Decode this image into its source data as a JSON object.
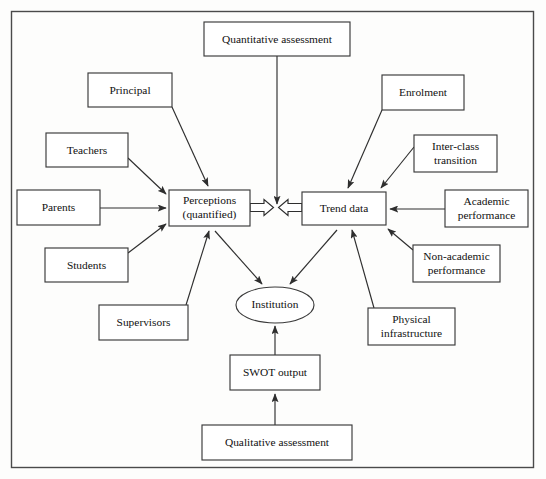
{
  "diagram": {
    "frame": {
      "x": 11,
      "y": 11,
      "width": 523,
      "height": 457
    },
    "colors": {
      "background": "#fdfdfc",
      "node_fill": "#ffffff",
      "node_stroke": "#3a3a3a",
      "edge_stroke": "#2e2e2e",
      "text": "#111111"
    },
    "nodes": [
      {
        "id": "quantitative_assessment",
        "label": "Quantitative assessment",
        "shape": "rect",
        "x": 204,
        "y": 22,
        "width": 146,
        "height": 34,
        "lines": [
          "Quantitative assessment"
        ]
      },
      {
        "id": "principal",
        "label": "Principal",
        "shape": "rect",
        "x": 88,
        "y": 73,
        "width": 84,
        "height": 34,
        "lines": [
          "Principal"
        ]
      },
      {
        "id": "enrolment",
        "label": "Enrolment",
        "shape": "rect",
        "x": 382,
        "y": 75,
        "width": 82,
        "height": 35,
        "lines": [
          "Enrolment"
        ]
      },
      {
        "id": "teachers",
        "label": "Teachers",
        "shape": "rect",
        "x": 46,
        "y": 133,
        "width": 82,
        "height": 34,
        "lines": [
          "Teachers"
        ]
      },
      {
        "id": "inter_class_transition",
        "label": "Inter-class transition",
        "shape": "rect",
        "x": 414,
        "y": 135,
        "width": 83,
        "height": 37,
        "lines": [
          "Inter-class",
          "transition"
        ]
      },
      {
        "id": "parents",
        "label": "Parents",
        "shape": "rect",
        "x": 17,
        "y": 190,
        "width": 83,
        "height": 35,
        "lines": [
          "Parents"
        ]
      },
      {
        "id": "perceptions",
        "label": "Perceptions (quantified)",
        "shape": "rect",
        "x": 169,
        "y": 190,
        "width": 81,
        "height": 36,
        "lines": [
          "Perceptions",
          "(quantified)"
        ]
      },
      {
        "id": "trend_data",
        "label": "Trend data",
        "shape": "rect",
        "x": 302,
        "y": 192,
        "width": 84,
        "height": 33,
        "lines": [
          "Trend data"
        ]
      },
      {
        "id": "academic_performance",
        "label": "Academic performance",
        "shape": "rect",
        "x": 445,
        "y": 190,
        "width": 83,
        "height": 37,
        "lines": [
          "Academic",
          "performance"
        ]
      },
      {
        "id": "students",
        "label": "Students",
        "shape": "rect",
        "x": 45,
        "y": 248,
        "width": 83,
        "height": 34,
        "lines": [
          "Students"
        ]
      },
      {
        "id": "non_academic_performance",
        "label": "Non-academic performance",
        "shape": "rect",
        "x": 413,
        "y": 245,
        "width": 87,
        "height": 37,
        "lines": [
          "Non-academic",
          "performance"
        ]
      },
      {
        "id": "institution",
        "label": "Institution",
        "shape": "ellipse",
        "x": 236,
        "y": 287,
        "width": 78,
        "height": 36,
        "lines": [
          "Institution"
        ]
      },
      {
        "id": "supervisors",
        "label": "Supervisors",
        "shape": "rect",
        "x": 99,
        "y": 305,
        "width": 89,
        "height": 35,
        "lines": [
          "Supervisors"
        ]
      },
      {
        "id": "physical_infrastructure",
        "label": "Physical infrastructure",
        "shape": "rect",
        "x": 368,
        "y": 308,
        "width": 87,
        "height": 37,
        "lines": [
          "Physical",
          "infrastructure"
        ]
      },
      {
        "id": "swot_output",
        "label": "SWOT output",
        "shape": "rect",
        "x": 230,
        "y": 355,
        "width": 90,
        "height": 35,
        "lines": [
          "SWOT output"
        ]
      },
      {
        "id": "qualitative_assessment",
        "label": "Qualitative assessment",
        "shape": "rect",
        "x": 202,
        "y": 425,
        "width": 150,
        "height": 35,
        "lines": [
          "Qualitative assessment"
        ]
      }
    ],
    "edges": [
      {
        "id": "principal-to-perceptions",
        "from": "principal",
        "to": "perceptions",
        "style": "line-arrow"
      },
      {
        "id": "teachers-to-perceptions",
        "from": "teachers",
        "to": "perceptions",
        "style": "line-arrow"
      },
      {
        "id": "parents-to-perceptions",
        "from": "parents",
        "to": "perceptions",
        "style": "line-arrow"
      },
      {
        "id": "students-to-perceptions",
        "from": "students",
        "to": "perceptions",
        "style": "line-arrow"
      },
      {
        "id": "supervisors-to-perceptions",
        "from": "supervisors",
        "to": "perceptions",
        "style": "line-arrow"
      },
      {
        "id": "enrolment-to-trend-data",
        "from": "enrolment",
        "to": "trend_data",
        "style": "line-arrow"
      },
      {
        "id": "inter-class-transition-to-trend-data",
        "from": "inter_class_transition",
        "to": "trend_data",
        "style": "line-arrow"
      },
      {
        "id": "academic-performance-to-trend-data",
        "from": "academic_performance",
        "to": "trend_data",
        "style": "line-arrow"
      },
      {
        "id": "non-academic-performance-to-trend-data",
        "from": "non_academic_performance",
        "to": "trend_data",
        "style": "line-arrow"
      },
      {
        "id": "physical-infrastructure-to-trend-data",
        "from": "physical_infrastructure",
        "to": "trend_data",
        "style": "line-arrow"
      },
      {
        "id": "quantitative-assessment-to-centre",
        "from": "quantitative_assessment",
        "to": "centre_junction",
        "style": "line-arrow"
      },
      {
        "id": "perceptions-to-centre",
        "from": "perceptions",
        "to": "centre_junction",
        "style": "block-arrow"
      },
      {
        "id": "trend-data-to-centre",
        "from": "trend_data",
        "to": "centre_junction",
        "style": "block-arrow"
      },
      {
        "id": "perceptions-to-institution",
        "from": "perceptions",
        "to": "institution",
        "style": "line-arrow"
      },
      {
        "id": "trend-data-to-institution",
        "from": "trend_data",
        "to": "institution",
        "style": "line-arrow"
      },
      {
        "id": "swot-output-to-institution",
        "from": "swot_output",
        "to": "institution",
        "style": "line-arrow"
      },
      {
        "id": "qualitative-assessment-to-swot-output",
        "from": "qualitative_assessment",
        "to": "swot_output",
        "style": "line-arrow"
      }
    ]
  }
}
